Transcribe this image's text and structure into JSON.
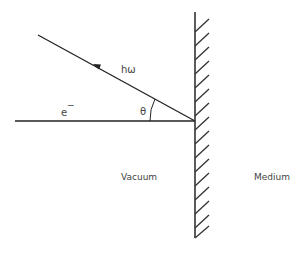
{
  "diagram": {
    "labels": {
      "photon": "hω",
      "electron": "e",
      "electron_charge": "−",
      "angle": "θ",
      "vacuum": "Vacuum",
      "medium": "Medium"
    },
    "colors": {
      "line": "#222222",
      "text": "#444444",
      "background": "#ffffff"
    }
  }
}
